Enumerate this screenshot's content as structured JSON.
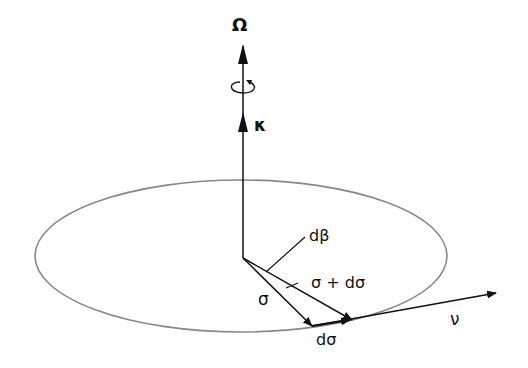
{
  "diagram": {
    "labels": {
      "omega": "Ω",
      "kappa": "κ",
      "dbeta": "dβ",
      "sigma": "σ",
      "sigma_plus_dsigma": "σ + dσ",
      "dsigma": "dσ",
      "nu": "ν"
    },
    "colors": {
      "ellipse": "#888888",
      "lines": "#111111"
    }
  }
}
